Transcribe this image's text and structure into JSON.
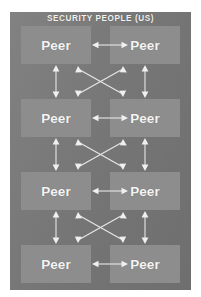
{
  "diagram": {
    "title": "SECURITY PEOPLE (US)",
    "type": "peer-to-peer-mesh",
    "node_label": "Peer",
    "rows": [
      {
        "left": "Peer",
        "right": "Peer"
      },
      {
        "left": "Peer",
        "right": "Peer"
      },
      {
        "left": "Peer",
        "right": "Peer"
      },
      {
        "left": "Peer",
        "right": "Peer"
      }
    ],
    "connectors": [
      {
        "vertical_left": "double-arrow",
        "vertical_right": "double-arrow",
        "cross": "x-double-arrow"
      },
      {
        "vertical_left": "double-arrow",
        "vertical_right": "double-arrow",
        "cross": "x-double-arrow"
      },
      {
        "vertical_left": "double-arrow",
        "vertical_right": "double-arrow",
        "cross": "x-double-arrow"
      }
    ],
    "colors": {
      "panel_background": "#7b7b7b",
      "node_background": "#8d8d8d",
      "text": "#f4f4f4",
      "connector": "#e8e8e8",
      "page_background": "#ffffff"
    }
  }
}
